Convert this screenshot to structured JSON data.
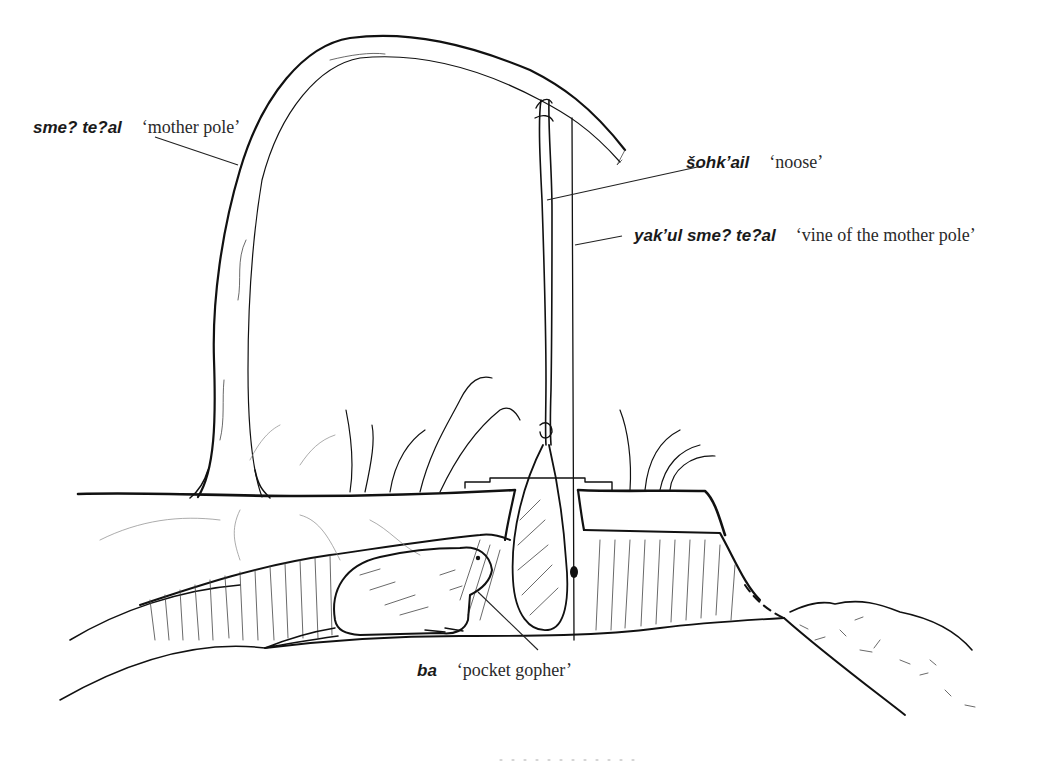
{
  "figure": {
    "labels": [
      {
        "id": "mother-pole",
        "term": "sme? te?al",
        "gloss": "‘mother pole’"
      },
      {
        "id": "noose",
        "term": "šohk’ail",
        "gloss": "‘noose’"
      },
      {
        "id": "vine",
        "term": "yak’ul sme? te?al",
        "gloss": "‘vine of the mother pole’"
      },
      {
        "id": "gopher",
        "term": "ba",
        "gloss": "‘pocket gopher’"
      }
    ],
    "colors": {
      "ink": "#111111",
      "background": "#ffffff"
    }
  }
}
